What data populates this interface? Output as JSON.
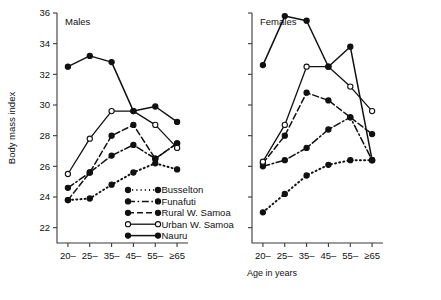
{
  "figure": {
    "y_axis_label": "Body mass index",
    "x_axis_label": "Age in years",
    "caption": ""
  },
  "panels": [
    {
      "title": "Males"
    },
    {
      "title": "Females"
    }
  ],
  "legend": {
    "items": [
      {
        "label": "Busselton",
        "style": "dotted",
        "marker": "filled"
      },
      {
        "label": "Funafuti",
        "style": "dashdot",
        "marker": "filled"
      },
      {
        "label": "Rural W. Samoa",
        "style": "dashed",
        "marker": "filled"
      },
      {
        "label": "Urban W. Samoa",
        "style": "solid",
        "marker": "open"
      },
      {
        "label": "Nauru",
        "style": "solid",
        "marker": "filled"
      }
    ]
  },
  "chart_data": {
    "type": "line",
    "xlabel": "Age in years",
    "ylabel": "Body mass index",
    "ylim": [
      21,
      36
    ],
    "yticks": [
      22,
      24,
      26,
      28,
      30,
      32,
      34,
      36
    ],
    "grid": false,
    "legend_position": "inside-lower-center-left-panel",
    "categories": [
      "20–",
      "25–",
      "35–",
      "45–",
      "55–",
      "≥65"
    ],
    "panels": [
      {
        "name": "Males",
        "series": [
          {
            "name": "Busselton",
            "values": [
              23.8,
              23.9,
              24.8,
              25.6,
              26.2,
              25.8
            ]
          },
          {
            "name": "Funafuti",
            "values": [
              24.6,
              25.6,
              26.7,
              27.4,
              26.5,
              27.5
            ]
          },
          {
            "name": "Rural W. Samoa",
            "values": [
              23.8,
              25.6,
              28.0,
              28.7,
              26.5,
              27.5
            ]
          },
          {
            "name": "Urban W. Samoa",
            "values": [
              25.5,
              27.8,
              29.6,
              29.6,
              28.7,
              27.2
            ]
          },
          {
            "name": "Nauru",
            "values": [
              32.5,
              33.2,
              32.8,
              29.6,
              29.9,
              28.9
            ]
          }
        ]
      },
      {
        "name": "Females",
        "series": [
          {
            "name": "Busselton",
            "values": [
              23.0,
              24.2,
              25.4,
              26.1,
              26.4,
              26.4
            ]
          },
          {
            "name": "Funafuti",
            "values": [
              26.0,
              26.4,
              27.2,
              28.4,
              29.2,
              26.4
            ]
          },
          {
            "name": "Rural W. Samoa",
            "values": [
              26.2,
              28.0,
              30.8,
              30.3,
              29.2,
              28.1
            ]
          },
          {
            "name": "Urban W. Samoa",
            "values": [
              26.3,
              28.7,
              32.5,
              32.5,
              31.2,
              29.6
            ]
          },
          {
            "name": "Nauru",
            "values": [
              32.6,
              35.8,
              35.5,
              32.5,
              33.8,
              26.4
            ]
          }
        ]
      }
    ]
  }
}
